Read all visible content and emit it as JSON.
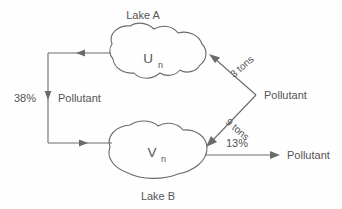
{
  "diagram": {
    "lake_a": {
      "name": "Lake A",
      "variable": "U",
      "subscript": "n"
    },
    "lake_b": {
      "name": "Lake B",
      "variable": "V",
      "subscript": "n"
    },
    "flows": {
      "a_to_b_rate": "38%",
      "a_to_b_substance": "Pollutant",
      "into_a_amount": "3 tons",
      "into_b_amount": "9 tons",
      "external_source": "Pollutant",
      "b_out_rate": "13%",
      "b_out_substance": "Pollutant"
    },
    "colors": {
      "stroke": "#6b6b6b",
      "text": "#555555",
      "background": "#fefefe"
    }
  }
}
